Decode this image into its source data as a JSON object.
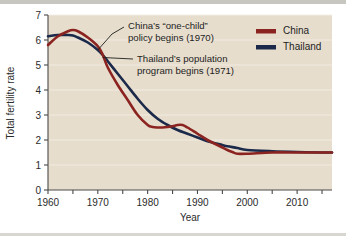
{
  "chart_data": {
    "type": "line",
    "title": "",
    "xlabel": "Year",
    "ylabel": "Total fertility rate",
    "xlim": [
      1960,
      2017
    ],
    "ylim": [
      0,
      7
    ],
    "xticks": [
      1960,
      1965,
      1970,
      1975,
      1980,
      1985,
      1990,
      1995,
      2000,
      2005,
      2010,
      2015
    ],
    "xtick_labels": [
      "1960",
      "",
      "1970",
      "",
      "1980",
      "",
      "1990",
      "",
      "2000",
      "",
      "2010",
      ""
    ],
    "xtick_labels_shown": [
      "1960",
      "1970",
      "1980",
      "1990",
      "2000",
      "2010"
    ],
    "yticks": [
      0,
      1,
      2,
      3,
      4,
      5,
      6,
      7
    ],
    "ytick_labels": [
      "0",
      "1",
      "2",
      "3",
      "4",
      "5",
      "6",
      "7"
    ],
    "grid": "horizontal-faint-white",
    "legend_position": "top-right",
    "plot_background": "#e7ddcd",
    "series": [
      {
        "name": "China",
        "color": "#8b2420",
        "x": [
          1960,
          1962,
          1964,
          1965,
          1966,
          1968,
          1970,
          1971,
          1972,
          1974,
          1976,
          1978,
          1980,
          1981,
          1982,
          1983,
          1984,
          1985,
          1986,
          1987,
          1988,
          1990,
          1992,
          1994,
          1995,
          1996,
          1997,
          1998,
          2000,
          2005,
          2010,
          2015,
          2017
        ],
        "values": [
          5.8,
          6.15,
          6.35,
          6.4,
          6.35,
          6.1,
          5.75,
          5.4,
          4.9,
          4.2,
          3.6,
          3.0,
          2.6,
          2.52,
          2.5,
          2.5,
          2.52,
          2.55,
          2.6,
          2.6,
          2.5,
          2.25,
          2.0,
          1.8,
          1.7,
          1.6,
          1.52,
          1.45,
          1.45,
          1.5,
          1.5,
          1.5,
          1.5
        ]
      },
      {
        "name": "Thailand",
        "color": "#1b2a4a",
        "x": [
          1960,
          1962,
          1964,
          1965,
          1966,
          1968,
          1970,
          1971,
          1972,
          1974,
          1976,
          1978,
          1980,
          1982,
          1984,
          1986,
          1988,
          1990,
          1992,
          1994,
          1995,
          1996,
          1998,
          2000,
          2005,
          2010,
          2015,
          2017
        ],
        "values": [
          6.15,
          6.2,
          6.2,
          6.18,
          6.1,
          5.9,
          5.6,
          5.4,
          5.15,
          4.65,
          4.15,
          3.65,
          3.2,
          2.85,
          2.6,
          2.4,
          2.25,
          2.1,
          1.95,
          1.85,
          1.8,
          1.75,
          1.68,
          1.6,
          1.55,
          1.52,
          1.5,
          1.5
        ]
      }
    ],
    "annotations": [
      {
        "id": "china-policy",
        "lines": [
          "China’s “one-child”",
          "policy begins (1970)"
        ],
        "target_year": 1970,
        "target_value": 5.6
      },
      {
        "id": "thailand-program",
        "lines": [
          "Thailand’s population",
          "program begins (1971)"
        ],
        "target_year": 1971,
        "target_value": 5.3
      }
    ]
  },
  "legend": {
    "items": [
      {
        "label": "China",
        "color": "#8b2420"
      },
      {
        "label": "Thailand",
        "color": "#1b2a4a"
      }
    ]
  },
  "axes": {
    "y_title": "Total fertility rate",
    "x_title": "Year"
  }
}
